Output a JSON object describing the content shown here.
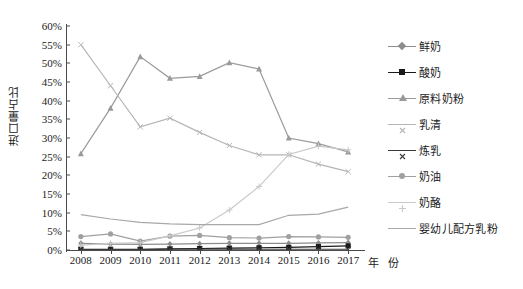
{
  "chart_data": {
    "type": "line",
    "title": "",
    "xlabel": "年 份",
    "ylabel": "进口量占比",
    "x": [
      "2008",
      "2009",
      "2010",
      "2011",
      "2012",
      "2013",
      "2014",
      "2015",
      "2016",
      "2017"
    ],
    "categories": [
      "2008",
      "2009",
      "2010",
      "2011",
      "2012",
      "2013",
      "2014",
      "2015",
      "2016",
      "2017"
    ],
    "ylim": [
      0,
      60
    ],
    "yticks": [
      "0%",
      "5%",
      "10%",
      "15%",
      "20%",
      "25%",
      "30%",
      "35%",
      "40%",
      "45%",
      "50%",
      "55%",
      "60%"
    ],
    "ytick_values": [
      0,
      5,
      10,
      15,
      20,
      25,
      30,
      35,
      40,
      45,
      50,
      55,
      60
    ],
    "grid": false,
    "legend_position": "right",
    "series": [
      {
        "name": "鲜奶",
        "marker": "diamond",
        "color": "#8c8c8c",
        "values": [
          1.8,
          1.6,
          1.5,
          1.6,
          1.7,
          1.8,
          1.8,
          1.8,
          1.9,
          2.0
        ]
      },
      {
        "name": "酸奶",
        "marker": "square",
        "color": "#1a1a1a",
        "values": [
          0.2,
          0.2,
          0.2,
          0.3,
          0.4,
          0.5,
          0.6,
          0.7,
          0.9,
          1.1
        ]
      },
      {
        "name": "原料奶粉",
        "marker": "triangle",
        "color": "#9a9a9a",
        "values": [
          25.8,
          38.0,
          51.8,
          46.0,
          46.5,
          50.2,
          48.5,
          30.0,
          28.5,
          26.3
        ]
      },
      {
        "name": "乳清",
        "marker": "x",
        "color": "#b5b5b5",
        "values": [
          55.0,
          44.0,
          33.0,
          35.3,
          31.5,
          28.0,
          25.5,
          25.5,
          23.0,
          21.0
        ]
      },
      {
        "name": "炼乳",
        "marker": "x-dark",
        "color": "#3a3a3a",
        "values": [
          0.1,
          0.1,
          0.1,
          0.2,
          0.2,
          0.2,
          0.2,
          0.2,
          0.2,
          0.2
        ]
      },
      {
        "name": "奶油",
        "marker": "circle",
        "color": "#a0a0a0",
        "values": [
          3.6,
          4.3,
          2.4,
          3.7,
          3.9,
          3.3,
          3.2,
          3.6,
          3.5,
          3.4
        ]
      },
      {
        "name": "奶酪",
        "marker": "plus",
        "color": "#c9c9c9",
        "values": [
          1.3,
          1.8,
          2.0,
          3.8,
          5.9,
          10.7,
          17.0,
          25.6,
          27.8,
          26.8
        ]
      },
      {
        "name": "婴幼儿配方乳粉",
        "marker": "none",
        "color": "#a8a8a8",
        "values": [
          9.5,
          8.3,
          7.4,
          7.0,
          6.8,
          6.8,
          6.8,
          9.3,
          9.6,
          11.5
        ]
      }
    ]
  },
  "legend": {
    "items": [
      {
        "label": "鲜奶"
      },
      {
        "label": "酸奶"
      },
      {
        "label": "原料奶粉"
      },
      {
        "label": "乳清"
      },
      {
        "label": "炼乳"
      },
      {
        "label": "奶油"
      },
      {
        "label": "奶酪"
      },
      {
        "label": "婴幼儿配方乳粉"
      }
    ]
  }
}
